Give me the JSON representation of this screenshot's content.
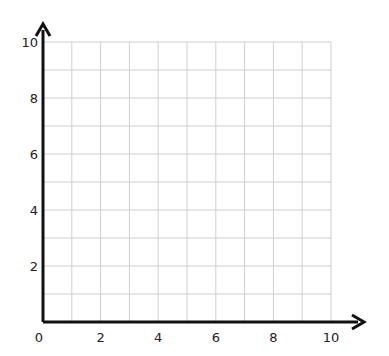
{
  "chart_data": {
    "type": "scatter",
    "title": "",
    "xlabel": "",
    "ylabel": "",
    "xlim": [
      0,
      10
    ],
    "ylim": [
      0,
      10
    ],
    "x_ticks": [
      "0",
      "2",
      "4",
      "6",
      "8",
      "10"
    ],
    "y_ticks": [
      "2",
      "4",
      "6",
      "8",
      "10"
    ],
    "grid": true,
    "grid_step": 1,
    "series": [],
    "legend": null
  },
  "colors": {
    "axis": "#111111",
    "grid": "#cfcfcf",
    "label": "#222222",
    "background": "#ffffff"
  }
}
